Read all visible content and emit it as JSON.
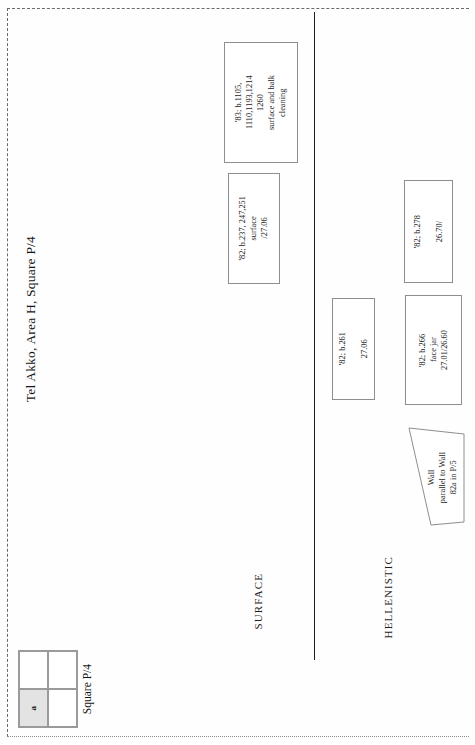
{
  "document": {
    "title": "Tel Akko, Area H, Square P/4"
  },
  "phases": [
    {
      "id": "surface",
      "label": "SURFACE"
    },
    {
      "id": "hellenistic",
      "label": "HELLENISTIC"
    }
  ],
  "loci": [
    {
      "id": "b1105",
      "phase": "surface",
      "text": "'83; b.1105,\n1110,1193,1214\n1260\nsurface and balk\ncleaning"
    },
    {
      "id": "b237",
      "phase": "surface",
      "text": "'82; b.237, 247,251\nsurface\n/27.06"
    },
    {
      "id": "b261",
      "phase": "hellenistic",
      "text": "'82; b.261\n\n27.06"
    },
    {
      "id": "b278",
      "phase": "hellenistic",
      "text": "'82; b.278\n\n26.70/"
    },
    {
      "id": "b266",
      "phase": "hellenistic",
      "text": "'82; b.266\nface jar\n27.01/26.60"
    }
  ],
  "wall": {
    "id": "wall-82a",
    "text": "Wall\nparallel to Wall\n82a in P/5"
  },
  "legend": {
    "caption": "Square P/4",
    "cells": [
      {
        "id": "top-left",
        "label": "",
        "shaded": false
      },
      {
        "id": "top-right",
        "label": "",
        "shaded": false
      },
      {
        "id": "bottom-left",
        "label": "a",
        "shaded": true
      },
      {
        "id": "bottom-right",
        "label": "",
        "shaded": false
      }
    ]
  },
  "colors": {
    "ink": "#1c1c1c",
    "box_border": "#8e8e8e",
    "phase_line": "#1c1c1c",
    "legend_shade": "#e3e3e3",
    "page": "#fefefe"
  }
}
